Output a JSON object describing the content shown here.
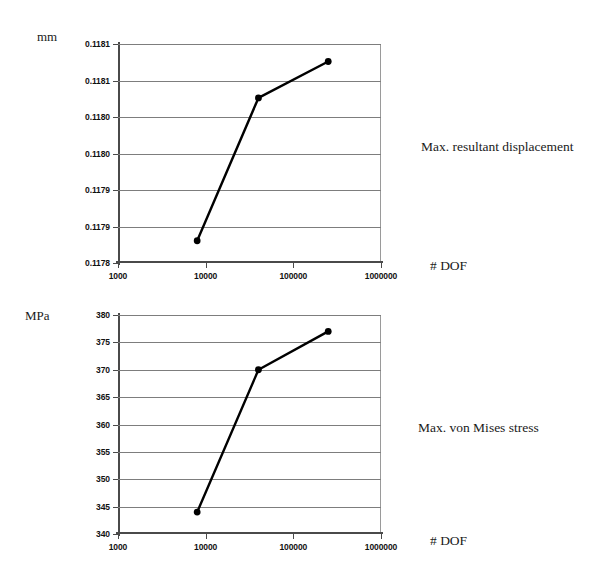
{
  "figure": {
    "background": "#ffffff",
    "line_color": "#000000",
    "grid_color": "#7d7d7d",
    "axis_color": "#4a4a4a"
  },
  "chart_data": [
    {
      "id": "displacement",
      "type": "line",
      "title": "",
      "unit_label": "mm",
      "side_label": "Max. resultant displacement",
      "xlabel": "# DOF",
      "ylabel": "mm",
      "xscale": "log",
      "xlim": [
        1000,
        1000000
      ],
      "ylim": [
        0.11782,
        0.118145
      ],
      "grid": true,
      "legend": "none",
      "xticks": [
        1000,
        10000,
        100000,
        1000000
      ],
      "xtick_labels": [
        "1000",
        "10000",
        "100000",
        "1000000"
      ],
      "yticks": [
        0.118145,
        0.118091,
        0.118036,
        0.117982,
        0.117928,
        0.117874,
        0.11782
      ],
      "ytick_labels": [
        "0.1181",
        "0.1181",
        "0.1180",
        "0.1180",
        "0.1179",
        "0.1179",
        "0.1178"
      ],
      "x": [
        8000,
        40000,
        250000
      ],
      "values": [
        0.117853,
        0.118065,
        0.118119
      ],
      "markers": "filled-circle"
    },
    {
      "id": "stress",
      "type": "line",
      "title": "",
      "unit_label": "MPa",
      "side_label": "Max. von Mises stress",
      "xlabel": "# DOF",
      "ylabel": "MPa",
      "xscale": "log",
      "xlim": [
        1000,
        1000000
      ],
      "ylim": [
        340,
        380
      ],
      "grid": true,
      "legend": "none",
      "xticks": [
        1000,
        10000,
        100000,
        1000000
      ],
      "xtick_labels": [
        "1000",
        "10000",
        "100000",
        "1000000"
      ],
      "yticks": [
        380,
        375,
        370,
        365,
        360,
        355,
        350,
        345,
        340
      ],
      "ytick_labels": [
        "380",
        "375",
        "370",
        "365",
        "360",
        "355",
        "350",
        "345",
        "340"
      ],
      "x": [
        8000,
        40000,
        250000
      ],
      "values": [
        344,
        370,
        377
      ],
      "markers": "filled-circle"
    }
  ]
}
